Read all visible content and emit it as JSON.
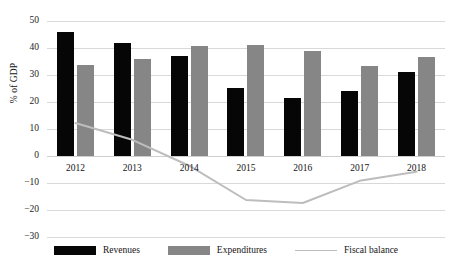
{
  "chart_data": {
    "type": "bar",
    "title": "",
    "subtitle": "",
    "xlabel": "",
    "ylabel": "% of GDP",
    "categories": [
      "2012",
      "2013",
      "2014",
      "2015",
      "2016",
      "2017",
      "2018"
    ],
    "ylim": [
      -30,
      50
    ],
    "ytick_step": 10,
    "yticks": [
      "50",
      "40",
      "30",
      "20",
      "10",
      "0",
      "−10",
      "−20",
      "−30"
    ],
    "ytick_values": [
      50,
      40,
      30,
      20,
      10,
      0,
      -10,
      -20,
      -30
    ],
    "grid": true,
    "legend_position": "bottom",
    "series": [
      {
        "name": "Revenues",
        "kind": "bar",
        "color": "#060606",
        "values": [
          45.8,
          41.8,
          37.0,
          25.2,
          21.6,
          24.2,
          31.0
        ]
      },
      {
        "name": "Expenditures",
        "kind": "bar",
        "color": "#868686",
        "values": [
          33.6,
          35.8,
          40.6,
          41.0,
          39.0,
          33.4,
          36.8
        ]
      },
      {
        "name": "Fiscal balance",
        "kind": "line",
        "color": "#bdbdbd",
        "values": [
          12.2,
          6.0,
          -3.6,
          -16.3,
          -17.4,
          -9.2,
          -5.8
        ]
      }
    ]
  },
  "legend": {
    "items": [
      {
        "label": "Revenues",
        "swatch": "black-rect-swatch"
      },
      {
        "label": "Expenditures",
        "swatch": "gray-rect-swatch"
      },
      {
        "label": "Fiscal balance",
        "swatch": "gray-line-swatch"
      }
    ]
  },
  "colors": {
    "revenues": "#060606",
    "expenditures": "#868686",
    "fiscal_balance": "#bdbdbd",
    "gridline": "#d9d9d9",
    "background": "#ffffff",
    "text": "#141414"
  }
}
